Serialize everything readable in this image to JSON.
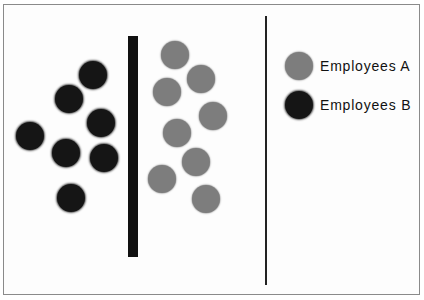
{
  "diagram": {
    "colors": {
      "employees_a": "#7d7d7d",
      "employees_b": "#151515",
      "barrier": "#111111",
      "divider": "#222222"
    },
    "employees_a_positions": [
      [
        175,
        55
      ],
      [
        201,
        79
      ],
      [
        167,
        92
      ],
      [
        213,
        116
      ],
      [
        177,
        133
      ],
      [
        196,
        162
      ],
      [
        162,
        179
      ],
      [
        206,
        199
      ]
    ],
    "employees_b_positions": [
      [
        93,
        75
      ],
      [
        69,
        99
      ],
      [
        101,
        123
      ],
      [
        30,
        136
      ],
      [
        66,
        153
      ],
      [
        104,
        158
      ],
      [
        71,
        198
      ]
    ],
    "legend": [
      {
        "label": "Employees A",
        "color": "#7d7d7d"
      },
      {
        "label": "Employees B",
        "color": "#151515"
      }
    ]
  }
}
